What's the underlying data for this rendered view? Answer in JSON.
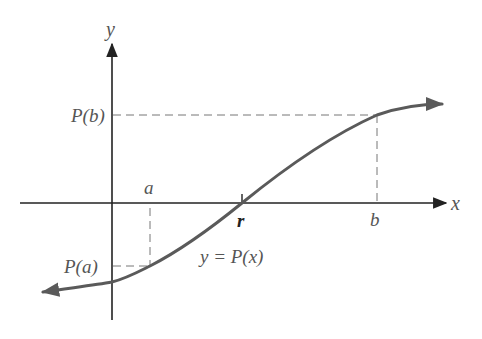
{
  "diagram": {
    "axes": {
      "x_label": "x",
      "y_label": "y"
    },
    "labels": {
      "a": "a",
      "b": "b",
      "r": "r",
      "P_a": "P(a)",
      "P_b": "P(b)",
      "curve": "y = P(x)"
    },
    "colors": {
      "axis": "#222222",
      "curve": "#5a5a5a",
      "dashed": "#777777",
      "text": "#555555"
    }
  }
}
